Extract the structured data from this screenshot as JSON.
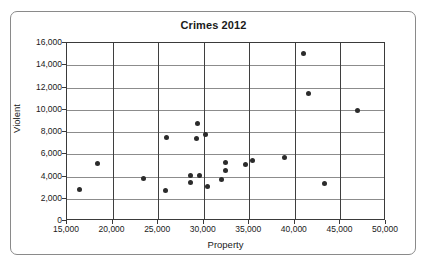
{
  "chart_data": {
    "type": "scatter",
    "title": "Crimes 2012",
    "xlabel": "Property",
    "ylabel": "Violent",
    "xlim": [
      15000,
      50000
    ],
    "ylim": [
      0,
      16000
    ],
    "xticks": [
      15000,
      20000,
      25000,
      30000,
      35000,
      40000,
      45000,
      50000
    ],
    "yticks": [
      0,
      2000,
      4000,
      6000,
      8000,
      10000,
      12000,
      14000,
      16000
    ],
    "xtick_labels": [
      "15,000",
      "20,000",
      "25,000",
      "30,000",
      "35,000",
      "40,000",
      "45,000",
      "50,000"
    ],
    "ytick_labels": [
      "0",
      "2,000",
      "4,000",
      "6,000",
      "8,000",
      "10,000",
      "12,000",
      "14,000",
      "16,000"
    ],
    "grid": true,
    "legend": false,
    "marker_color": "#2b2b2b",
    "points": [
      {
        "x": 16400,
        "y": 2850
      },
      {
        "x": 18400,
        "y": 5200
      },
      {
        "x": 23400,
        "y": 3850
      },
      {
        "x": 25800,
        "y": 2750
      },
      {
        "x": 25900,
        "y": 7500
      },
      {
        "x": 28600,
        "y": 4050
      },
      {
        "x": 28600,
        "y": 3500
      },
      {
        "x": 29200,
        "y": 7400
      },
      {
        "x": 29300,
        "y": 8750
      },
      {
        "x": 29500,
        "y": 4100
      },
      {
        "x": 30200,
        "y": 7750
      },
      {
        "x": 30400,
        "y": 3100
      },
      {
        "x": 31900,
        "y": 3750
      },
      {
        "x": 32400,
        "y": 5250
      },
      {
        "x": 32400,
        "y": 4500
      },
      {
        "x": 34600,
        "y": 5100
      },
      {
        "x": 35400,
        "y": 5450
      },
      {
        "x": 38900,
        "y": 5700
      },
      {
        "x": 40900,
        "y": 15050
      },
      {
        "x": 41500,
        "y": 11500
      },
      {
        "x": 43300,
        "y": 3350
      },
      {
        "x": 46900,
        "y": 9900
      }
    ]
  }
}
